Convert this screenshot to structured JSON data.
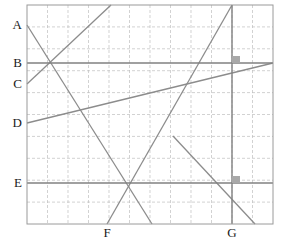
{
  "figure": {
    "width": 281,
    "height": 244,
    "background": "#ffffff"
  },
  "plot_area": {
    "left": 27,
    "top": 5,
    "right": 273,
    "bottom": 224,
    "border_color": "#9a9a9a",
    "grid_color": "#bfbfbf",
    "grid_style": "dashed",
    "grid_columns": 12,
    "grid_rows": 10
  },
  "axis_labels": {
    "y": [
      {
        "text": "A",
        "y": 25
      },
      {
        "text": "B",
        "y": 63
      },
      {
        "text": "C",
        "y": 84
      },
      {
        "text": "D",
        "y": 123
      },
      {
        "text": "E",
        "y": 183
      }
    ],
    "x": [
      {
        "text": "F",
        "x": 107
      },
      {
        "text": "G",
        "x": 232
      }
    ]
  },
  "chart_data": {
    "type": "line",
    "title": "",
    "xlabel": "",
    "ylabel": "",
    "grid": true,
    "legend": "none",
    "axis_tick_labels": {
      "y": [
        "A",
        "B",
        "C",
        "D",
        "E"
      ],
      "x": [
        "F",
        "G"
      ]
    },
    "reference_lines": {
      "horizontal": [
        {
          "label": "B",
          "y": 63,
          "x1": 27,
          "x2": 273,
          "color": "#808080",
          "width": 1.6
        },
        {
          "label": "E",
          "y": 183,
          "x1": 27,
          "x2": 273,
          "color": "#808080",
          "width": 1.6
        }
      ],
      "vertical": [
        {
          "label": "G",
          "x": 232,
          "y1": 5,
          "y2": 224,
          "color": "#808080",
          "width": 1.4
        }
      ]
    },
    "segments": [
      {
        "name": "line-1-from-A-descending",
        "x1": 27,
        "y1": 25,
        "x2": 152,
        "y2": 224,
        "color": "#8c8c8c",
        "width": 1.3
      },
      {
        "name": "line-2-from-C-ascending",
        "x1": 27,
        "y1": 84,
        "x2": 111,
        "y2": 5,
        "color": "#8c8c8c",
        "width": 1.3
      },
      {
        "name": "line-3-from-D-ascending",
        "x1": 27,
        "y1": 123,
        "x2": 273,
        "y2": 63,
        "color": "#8c8c8c",
        "width": 1.3
      },
      {
        "name": "line-4-from-F-ascending",
        "x1": 107,
        "y1": 224,
        "x2": 232,
        "y2": 5,
        "color": "#8c8c8c",
        "width": 1.3
      },
      {
        "name": "line-5-through-G-descending",
        "x1": 173,
        "y1": 136,
        "x2": 255,
        "y2": 224,
        "color": "#8c8c8c",
        "width": 1.3
      }
    ],
    "markers": [
      {
        "name": "marker-upper",
        "x": 232,
        "y": 56,
        "width": 8,
        "height": 7,
        "color": "#a8a8a8",
        "sits_on": "B"
      },
      {
        "name": "marker-lower",
        "x": 232,
        "y": 176,
        "width": 8,
        "height": 7,
        "color": "#a8a8a8",
        "sits_on": "E"
      }
    ]
  }
}
